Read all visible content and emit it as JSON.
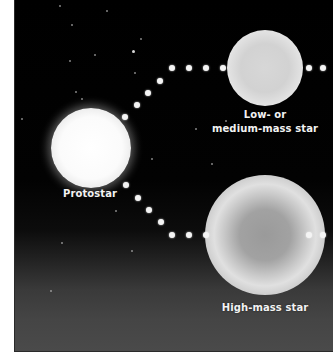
{
  "diagram": {
    "colors": {
      "background_top": "#000000",
      "background_bottom": "#4a4a4a",
      "label_text": "#f2f2f2",
      "path_dots": "#f4f4f4",
      "page_margin": "#ffffff"
    },
    "nodes": [
      {
        "id": "protostar",
        "label": "Protostar"
      },
      {
        "id": "low-medium-mass-star",
        "label_line1": "Low- or",
        "label_line2": "medium-mass star"
      },
      {
        "id": "high-mass-star",
        "label": "High-mass star"
      }
    ],
    "labels": {
      "protostar": "Protostar",
      "low_line1": "Low- or",
      "low_line2": "medium-mass star",
      "high": "High-mass star"
    },
    "edges": [
      {
        "from": "protostar",
        "to": "low-medium-mass-star",
        "style": "dotted"
      },
      {
        "from": "protostar",
        "to": "high-mass-star",
        "style": "dotted"
      },
      {
        "from": "low-medium-mass-star",
        "to": "offscreen-right",
        "style": "dotted"
      },
      {
        "from": "high-mass-star",
        "to": "offscreen-right",
        "style": "dotted"
      }
    ]
  }
}
